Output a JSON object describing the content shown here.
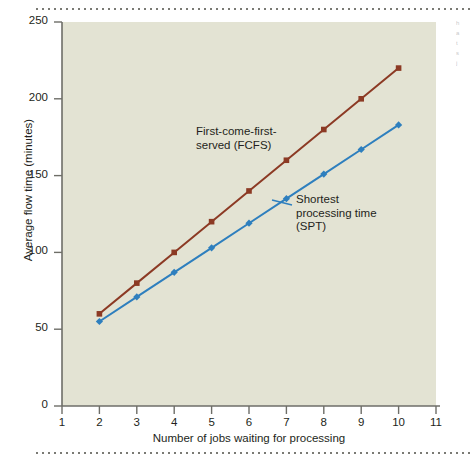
{
  "figure": {
    "background_color": "#ffffff",
    "plot_background_color": "#e3e3d3",
    "edge_bleed_text": "h\na\nt\ns\nj"
  },
  "chart_data": {
    "type": "line",
    "title": "",
    "xlabel": "Number of jobs waiting for processing",
    "ylabel": "Average flow time (minutes)",
    "xlim": [
      1,
      11
    ],
    "ylim": [
      0,
      250
    ],
    "xticks": [
      1,
      2,
      3,
      4,
      5,
      6,
      7,
      8,
      9,
      10,
      11
    ],
    "yticks": [
      0,
      50,
      100,
      150,
      200,
      250
    ],
    "xtick_labels": [
      "1",
      "2",
      "3",
      "4",
      "5",
      "6",
      "7",
      "8",
      "9",
      "10",
      "11"
    ],
    "ytick_labels": [
      "0",
      "50",
      "100",
      "150",
      "200",
      "250"
    ],
    "grid": false,
    "legend_position": "inline-annotations",
    "x": [
      2,
      3,
      4,
      5,
      6,
      7,
      8,
      9,
      10
    ],
    "series": [
      {
        "name": "First-come-first-served (FCFS)",
        "short_name": "FCFS",
        "color": "#8c3a24",
        "marker": "square",
        "values": [
          60,
          80,
          100,
          120,
          140,
          160,
          180,
          200,
          220
        ]
      },
      {
        "name": "Shortest processing time (SPT)",
        "short_name": "SPT",
        "color": "#2e7fbe",
        "marker": "diamond",
        "values": [
          55,
          71,
          87,
          103,
          119,
          135,
          151,
          167,
          183
        ]
      }
    ],
    "annotations": [
      {
        "id": "fcfs",
        "text": "First-come-first-\nserved (FCFS)",
        "target_series": "First-come-first-served (FCFS)"
      },
      {
        "id": "spt",
        "text": "Shortest\nprocessing time\n(SPT)",
        "target_series": "Shortest processing time (SPT)"
      }
    ]
  }
}
